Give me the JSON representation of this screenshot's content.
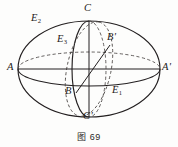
{
  "figure": {
    "caption_prefix": "图",
    "caption_number": "69",
    "caption_full": "图 69"
  },
  "colors": {
    "stroke": "#231f20",
    "dashed_stroke": "#4a4644",
    "background": "#fdfdfc",
    "label_text": "#1d1b1a",
    "caption_text": "#2b2927"
  },
  "labels": [
    {
      "id": "A",
      "text": "A",
      "prime": "",
      "sub": "",
      "x": 7,
      "y": 62
    },
    {
      "id": "Aprime",
      "text": "A",
      "prime": "'",
      "sub": "",
      "x": 162,
      "y": 62
    },
    {
      "id": "C",
      "text": "C",
      "prime": "",
      "sub": "",
      "x": 84,
      "y": 3
    },
    {
      "id": "Cprime",
      "text": "C",
      "prime": "'",
      "sub": "",
      "x": 83,
      "y": 111
    },
    {
      "id": "B",
      "text": "B",
      "prime": "",
      "sub": "",
      "x": 65,
      "y": 86
    },
    {
      "id": "Bprime",
      "text": "B",
      "prime": "'",
      "sub": "",
      "x": 107,
      "y": 32
    },
    {
      "id": "E1",
      "text": "E",
      "prime": "",
      "sub": "1",
      "x": 112,
      "y": 85
    },
    {
      "id": "E2",
      "text": "E",
      "prime": "",
      "sub": "2",
      "x": 31,
      "y": 13
    },
    {
      "id": "E3",
      "text": "E",
      "prime": "",
      "sub": "3",
      "x": 57,
      "y": 34
    }
  ],
  "geometry": {
    "center": {
      "x": 89,
      "y": 69
    },
    "outer_ellipse": {
      "cx": 89,
      "cy": 69,
      "rx": 71,
      "ry": 48
    },
    "equator_ellipse": {
      "cx": 89,
      "cy": 69,
      "rx": 71,
      "ry": 17
    },
    "meridian_ellipse": {
      "cx": 89,
      "cy": 69,
      "rx": 17,
      "ry": 48
    },
    "oblique_ellipse": {
      "cx": 89,
      "cy": 69,
      "rx": 22,
      "ry": 48,
      "rotate": 12
    },
    "axis_horizontal": {
      "x1": 18,
      "y1": 69,
      "x2": 160,
      "y2": 69
    },
    "axis_vertical": {
      "x1": 89,
      "y1": 21,
      "x2": 89,
      "y2": 117
    },
    "axis_oblique": {
      "x1": 76,
      "y1": 93,
      "x2": 110,
      "y2": 45
    },
    "vertices": {
      "A": {
        "x": 18,
        "y": 69
      },
      "Aprime": {
        "x": 160,
        "y": 69
      },
      "C": {
        "x": 89,
        "y": 21
      },
      "Cprime": {
        "x": 89,
        "y": 117
      },
      "B": {
        "x": 76,
        "y": 93
      },
      "Bprime": {
        "x": 110,
        "y": 45
      }
    }
  }
}
